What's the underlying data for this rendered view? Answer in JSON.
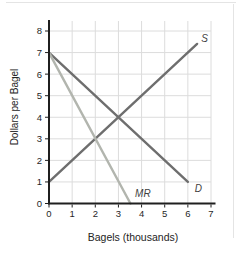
{
  "figure": {
    "xlabel": "Bagels (thousands)",
    "ylabel": "Dollars per Bagel"
  },
  "chart_data": {
    "type": "line",
    "title": "",
    "xlabel": "Bagels (thousands)",
    "ylabel": "Dollars per Bagel",
    "xlim": [
      0,
      7
    ],
    "ylim": [
      0,
      8
    ],
    "x_ticks": [
      "0",
      "1",
      "2",
      "3",
      "4",
      "5",
      "6",
      "7"
    ],
    "y_ticks": [
      "0",
      "1",
      "2",
      "3",
      "4",
      "5",
      "6",
      "7",
      "8"
    ],
    "grid": true,
    "legend": "none",
    "series": [
      {
        "name": "S",
        "label": "S",
        "points": [
          [
            0,
            1
          ],
          [
            6.4,
            7.4
          ]
        ],
        "color": "#6e6e6e",
        "label_pos": [
          6.58,
          7.5
        ]
      },
      {
        "name": "D",
        "label": "D",
        "points": [
          [
            0,
            7
          ],
          [
            6,
            1
          ]
        ],
        "color": "#6e6e6e",
        "label_pos": [
          6.3,
          0.55
        ]
      },
      {
        "name": "MR",
        "label": "MR",
        "points": [
          [
            0,
            7
          ],
          [
            3.52,
            0
          ]
        ],
        "color": "#b2b5ae",
        "label_pos": [
          3.72,
          0.3
        ]
      }
    ]
  },
  "style": {
    "axis_color": "#1f1f1f",
    "grid_color": "#dcdcdc",
    "tick_label_color": "#1f1f1f",
    "curve_label_color": "#3f3f3f",
    "background": "#ffffff"
  }
}
